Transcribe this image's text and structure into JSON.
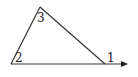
{
  "diagram": {
    "type": "triangle-exterior-angle",
    "vertices": {
      "top": {
        "x": 40,
        "y": 7
      },
      "bottom_left": {
        "x": 11,
        "y": 64
      },
      "bottom_right": {
        "x": 105,
        "y": 64
      }
    },
    "extension": {
      "from_x": 105,
      "to_x": 128,
      "y": 64,
      "arrow": true
    },
    "angle_labels": [
      {
        "id": "1",
        "text": "1",
        "position": "exterior angle at bottom-right vertex"
      },
      {
        "id": "2",
        "text": "2",
        "position": "interior angle at bottom-left vertex"
      },
      {
        "id": "3",
        "text": "3",
        "position": "interior angle at top vertex"
      }
    ],
    "stroke_color": "#333333"
  }
}
